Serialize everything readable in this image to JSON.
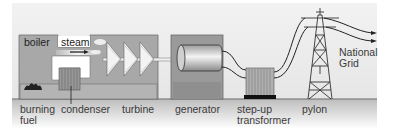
{
  "diagram": {
    "components": [
      {
        "id": "boiler",
        "label": "boiler"
      },
      {
        "id": "steam",
        "label": "steam"
      },
      {
        "id": "burning-fuel",
        "label_line1": "burning",
        "label_line2": "fuel"
      },
      {
        "id": "condenser",
        "label": "condenser"
      },
      {
        "id": "turbine",
        "label": "turbine"
      },
      {
        "id": "generator",
        "label": "generator"
      },
      {
        "id": "step-up-transformer",
        "label_line1": "step-up",
        "label_line2": "transformer"
      },
      {
        "id": "pylon",
        "label": "pylon"
      },
      {
        "id": "national-grid",
        "label_line1": "National",
        "label_line2": "Grid"
      }
    ],
    "flow": [
      "burning fuel",
      "boiler",
      "steam",
      "turbine",
      "generator",
      "step-up transformer",
      "pylon",
      "National Grid"
    ],
    "colors": {
      "sky": "#e9e9e9",
      "ground": "#c8c8c8",
      "building": "#a9a9a9",
      "building_dark": "#8e8e8e",
      "outline": "#4a4a4a",
      "text": "#3a3a3a"
    }
  }
}
